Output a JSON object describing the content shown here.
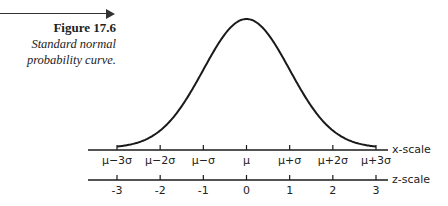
{
  "figure": {
    "number": "Figure 17.6",
    "description_line1": "Standard normal",
    "description_line2": "probability curve."
  },
  "chart_data": {
    "type": "line",
    "title": "Standard normal probability curve",
    "curve": "standard normal density (mean 0, sd 1)",
    "x_range": [
      -3,
      3
    ],
    "axes": [
      {
        "name": "x-scale",
        "ticks": [
          -3,
          -2,
          -1,
          0,
          1,
          2,
          3
        ],
        "tick_labels": [
          "μ−3σ",
          "μ−2σ",
          "μ−σ",
          "μ",
          "μ+σ",
          "μ+2σ",
          "μ+3σ"
        ]
      },
      {
        "name": "z-scale",
        "ticks": [
          -3,
          -2,
          -1,
          0,
          1,
          2,
          3
        ],
        "tick_labels": [
          "-3",
          "-2",
          "-1",
          "0",
          "1",
          "2",
          "3"
        ]
      }
    ],
    "grid": false,
    "legend": "none"
  }
}
